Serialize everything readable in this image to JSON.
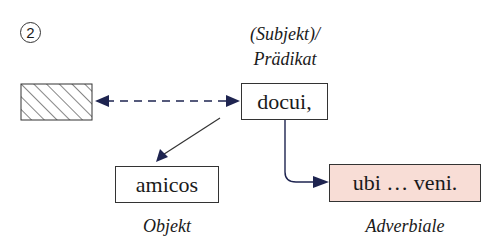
{
  "diagram": {
    "number": "2",
    "predicate_label_line1": "(Subjekt)/",
    "predicate_label_line2": "Prädikat",
    "predicate_word": "docui,",
    "object_word": "amicos",
    "object_label": "Objekt",
    "adverbial_word": "ubi … veni.",
    "adverbial_label": "Adverbiale",
    "colors": {
      "adverbial_fill": "#f8ddd6",
      "arrow": "#1e2450",
      "border": "#333333"
    }
  }
}
